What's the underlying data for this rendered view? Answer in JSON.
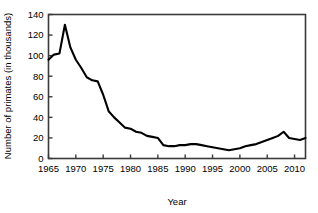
{
  "chart_data": {
    "type": "line",
    "title": "",
    "xlabel": "Year",
    "ylabel": "Number of primates (in thousands)",
    "xlim": [
      1965,
      2012
    ],
    "ylim": [
      0,
      140
    ],
    "xticks": [
      1965,
      1970,
      1975,
      1980,
      1985,
      1990,
      1995,
      2000,
      2005,
      2010
    ],
    "yticks": [
      0,
      20,
      40,
      60,
      80,
      100,
      120,
      140
    ],
    "grid": false,
    "legend": "none",
    "series": [
      {
        "name": "Number of primates",
        "color": "#000000",
        "x": [
          1965,
          1966,
          1967,
          1968,
          1969,
          1970,
          1971,
          1972,
          1973,
          1974,
          1975,
          1976,
          1977,
          1978,
          1979,
          1980,
          1981,
          1982,
          1983,
          1984,
          1985,
          1986,
          1987,
          1988,
          1989,
          1990,
          1991,
          1992,
          1993,
          1994,
          1995,
          1996,
          1997,
          1998,
          1999,
          2000,
          2001,
          2002,
          2003,
          2004,
          2005,
          2006,
          2007,
          2008,
          2009,
          2010,
          2011,
          2012
        ],
        "values": [
          96,
          101,
          102,
          130,
          108,
          96,
          88,
          79,
          76,
          75,
          62,
          46,
          40,
          35,
          30,
          29,
          26,
          25,
          22,
          21,
          20,
          13,
          12,
          12,
          13,
          13,
          14,
          14,
          13,
          12,
          11,
          10,
          9,
          8,
          9,
          10,
          12,
          13,
          14,
          16,
          18,
          20,
          22,
          26,
          20,
          19,
          18,
          20
        ]
      }
    ]
  },
  "axis": {
    "y_tick_labels": [
      "140",
      "120",
      "100",
      "80",
      "60",
      "40",
      "20",
      "0"
    ],
    "x_tick_labels": [
      "1965",
      "1970",
      "1975",
      "1980",
      "1985",
      "1990",
      "1995",
      "2000",
      "2005",
      "2010"
    ],
    "x_axis_title": "Year",
    "y_axis_title": "Number of primates (in thousands)"
  }
}
